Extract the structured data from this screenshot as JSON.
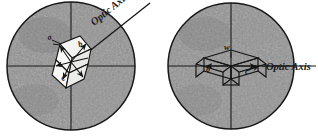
{
  "figure": {
    "background_color": "#ffffff",
    "disc_fill_color": "#8d8d8d",
    "disc_stroke_color": "#1c1c1c",
    "ink_color": "#141414",
    "crystal_face_color": "#f2f2f0"
  },
  "panels": [
    {
      "id": "left-panel",
      "name": "oblique-optic-axis-view",
      "disc": {
        "cx": 71,
        "cy": 66,
        "r": 64
      },
      "crosshair": {
        "horizontal_y": 66,
        "vertical_x": 71
      },
      "optic_axis": {
        "label": "Optic Axis",
        "orientation": "oblique",
        "x1": 63,
        "y1": 72,
        "x2": 148,
        "y2": 4,
        "label_angle_deg": -39
      },
      "crystal": {
        "type": "rhombohedron",
        "orientation": "tilted",
        "vertex_labels": [
          "a",
          "b",
          "c"
        ]
      }
    },
    {
      "id": "right-panel",
      "name": "horizontal-optic-axis-view",
      "disc": {
        "cx": 231,
        "cy": 66,
        "r": 63
      },
      "crosshair": {
        "horizontal_y": 66,
        "vertical_x": 231
      },
      "optic_axis": {
        "label": "Optic Axis",
        "orientation": "horizontal",
        "x1": 168,
        "y1": 66,
        "x2": 316,
        "y2": 66,
        "label_angle_deg": 0
      },
      "crystal": {
        "type": "rhombohedron",
        "orientation": "flat",
        "vertex_labels": [
          "w",
          "b",
          "c"
        ]
      }
    }
  ],
  "labels": {
    "optic_axis_text": "Optic Axis",
    "left_vertex_a": "a",
    "left_vertex_b": "b",
    "left_vertex_c": "c",
    "right_vertex_w": "w",
    "right_vertex_b": "b",
    "right_vertex_c": "c"
  }
}
